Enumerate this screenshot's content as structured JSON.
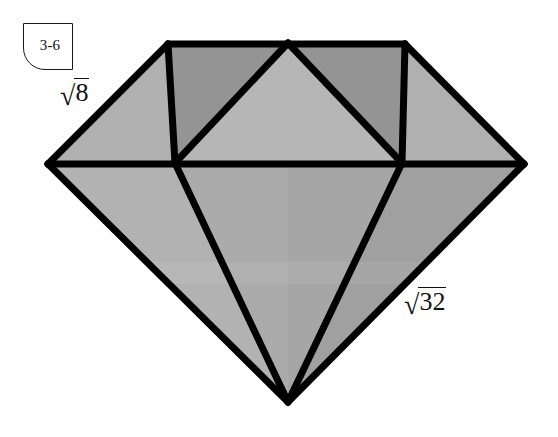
{
  "figure": {
    "background_color": "#ffffff",
    "outline_color": "#000000",
    "callout": {
      "label": "3-6",
      "shape": "rounded-bottom-left-box",
      "border_color": "#1a1a1a",
      "fill_color": "#ffffff"
    },
    "labels": [
      {
        "name": "crown-edge-length",
        "radical_sign": "√",
        "radicand": "8",
        "full_text": "√8",
        "x": 60,
        "y": 78
      },
      {
        "name": "pavilion-edge-length",
        "radical_sign": "√",
        "radicand": "32",
        "full_text": "√32",
        "x": 404,
        "y": 287
      }
    ],
    "palette": {
      "facet_dark": "#949494",
      "facet_mid": "#a6a6a6",
      "facet_light": "#b6b6b6",
      "facet_pavilion_light": "#b4b4b4",
      "facet_pavilion_mid": "#a8a8a8",
      "facet_pavilion_dark": "#9e9e9e",
      "stroke": "#000000"
    },
    "geometry": {
      "stroke_width": 7,
      "vertices": {
        "table_left": [
          168,
          44
        ],
        "table_apex": [
          288,
          43
        ],
        "table_right": [
          405,
          44
        ],
        "girdle_left": [
          48,
          164
        ],
        "girdle_inner_left": [
          175,
          163
        ],
        "girdle_inner_right": [
          402,
          163
        ],
        "girdle_right": [
          524,
          164
        ],
        "culet": [
          288,
          402
        ]
      },
      "facets": [
        {
          "name": "crown-left-triangle",
          "points": "168,44 175,163 48,164",
          "fill": "#b0b0b0"
        },
        {
          "name": "crown-table-left",
          "points": "168,44 288,43 175,163",
          "fill": "#949494"
        },
        {
          "name": "crown-center-triangle",
          "points": "288,43 402,163 175,163",
          "fill": "#b6b6b6"
        },
        {
          "name": "crown-table-right",
          "points": "288,43 405,44 402,163",
          "fill": "#949494"
        },
        {
          "name": "crown-right-triangle",
          "points": "405,44 524,164 402,163",
          "fill": "#b0b0b0"
        },
        {
          "name": "pavilion-far-left",
          "points": "48,164 175,163 288,402",
          "fill": "#b2b2b2"
        },
        {
          "name": "pavilion-center-left",
          "points": "175,163 288,163 288,402",
          "fill": "#ababab"
        },
        {
          "name": "pavilion-center-right",
          "points": "288,163 402,163 288,402",
          "fill": "#a6a6a6"
        },
        {
          "name": "pavilion-far-right",
          "points": "402,163 524,164 288,402",
          "fill": "#a0a0a0"
        }
      ],
      "edges": [
        {
          "name": "table-top-edge",
          "from": [
            168,
            44
          ],
          "to": [
            405,
            44
          ]
        },
        {
          "name": "crown-upper-left-edge",
          "from": [
            168,
            44
          ],
          "to": [
            48,
            164
          ]
        },
        {
          "name": "crown-upper-right-edge",
          "from": [
            405,
            44
          ],
          "to": [
            524,
            164
          ]
        },
        {
          "name": "girdle-line",
          "from": [
            48,
            164
          ],
          "to": [
            524,
            164
          ]
        },
        {
          "name": "crown-left-vertical",
          "from": [
            168,
            44
          ],
          "to": [
            175,
            163
          ]
        },
        {
          "name": "crown-right-vertical",
          "from": [
            405,
            44
          ],
          "to": [
            402,
            163
          ]
        },
        {
          "name": "crown-center-left-diagonal",
          "from": [
            288,
            43
          ],
          "to": [
            175,
            163
          ]
        },
        {
          "name": "crown-center-right-diagonal",
          "from": [
            288,
            43
          ],
          "to": [
            402,
            163
          ]
        },
        {
          "name": "pavilion-left-outer-edge",
          "from": [
            48,
            164
          ],
          "to": [
            288,
            402
          ]
        },
        {
          "name": "pavilion-right-outer-edge",
          "from": [
            524,
            164
          ],
          "to": [
            288,
            402
          ]
        },
        {
          "name": "pavilion-left-inner-edge",
          "from": [
            175,
            163
          ],
          "to": [
            288,
            402
          ]
        },
        {
          "name": "pavilion-right-inner-edge",
          "from": [
            402,
            163
          ],
          "to": [
            288,
            402
          ]
        }
      ]
    }
  }
}
